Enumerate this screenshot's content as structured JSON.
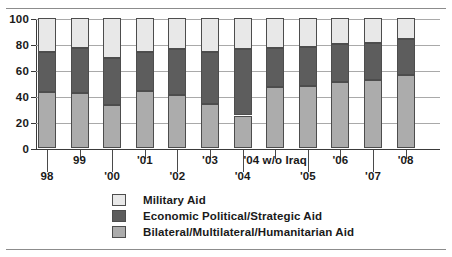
{
  "chart_data": {
    "type": "bar",
    "subtype": "stacked-bar",
    "title": "",
    "subtitle": "",
    "xlabel": "",
    "ylabel": "",
    "ylim": [
      0,
      100
    ],
    "yticks": [
      0,
      20,
      40,
      60,
      80,
      100
    ],
    "ytick_labels": [
      "0",
      "20",
      "40",
      "60",
      "80",
      "100"
    ],
    "grid": "horizontal",
    "legend_position": "bottom",
    "categories": [
      "98",
      "99",
      "'00",
      "'01",
      "'02",
      "'03",
      "'04",
      "'04 w/o Iraq",
      "'05",
      "'06",
      "'07",
      "'08"
    ],
    "category_label_rows": [
      "lower",
      "upper",
      "lower",
      "upper",
      "lower",
      "upper",
      "lower",
      "upper",
      "lower",
      "upper",
      "lower",
      "upper"
    ],
    "series": [
      {
        "name": "Bilateral/Multilateral/Humanitarian Aid",
        "color": "#acacac",
        "stack_order": 1,
        "values": [
          43,
          42,
          33,
          44,
          41,
          34,
          25,
          47,
          48,
          51,
          52,
          56
        ]
      },
      {
        "name": "Economic Political/Strategic Aid",
        "color": "#5d5d5d",
        "stack_order": 2,
        "values": [
          31,
          35,
          36,
          30,
          35,
          40,
          51,
          30,
          30,
          29,
          29,
          28
        ]
      },
      {
        "name": "Military Aid",
        "color": "#e8e8e8",
        "stack_order": 3,
        "values": [
          26,
          23,
          31,
          26,
          24,
          26,
          24,
          23,
          22,
          20,
          19,
          16
        ]
      }
    ],
    "cumulative_tops": {
      "bilateral": [
        43,
        42,
        33,
        44,
        41,
        34,
        25,
        47,
        48,
        51,
        52,
        56
      ],
      "economic": [
        74,
        77,
        69,
        74,
        76,
        74,
        76,
        77,
        78,
        80,
        81,
        84
      ],
      "military": [
        100,
        100,
        100,
        100,
        100,
        100,
        100,
        100,
        100,
        100,
        100,
        100
      ]
    }
  },
  "legend": {
    "entries": [
      {
        "label": "Military Aid",
        "swatch": "mil",
        "swatch_name": "legend-swatch-military-aid"
      },
      {
        "label": "Economic Political/Strategic Aid",
        "swatch": "econ",
        "swatch_name": "legend-swatch-economic-aid"
      },
      {
        "label": "Bilateral/Multilateral/Humanitarian Aid",
        "swatch": "bil",
        "swatch_name": "legend-swatch-bilateral-aid"
      }
    ]
  },
  "colors": {
    "military": "#e8e8e8",
    "economic": "#5d5d5d",
    "bilateral": "#acacac",
    "axis": "#3a3a3a",
    "gridline": "#a9a9a9",
    "rule": "#8c8c8c",
    "text": "#1a1a1a"
  }
}
